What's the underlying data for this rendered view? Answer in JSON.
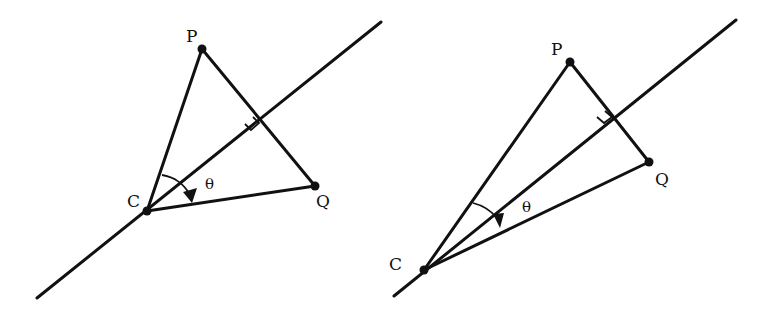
{
  "figures": [
    {
      "name": "left",
      "labels": {
        "P": "P",
        "Q": "Q",
        "C": "C",
        "theta": "θ"
      },
      "points": {
        "C": [
          147,
          211
        ],
        "P": [
          202,
          49
        ],
        "Q": [
          315,
          186
        ]
      },
      "axis_line": [
        [
          37,
          298
        ],
        [
          381,
          22
        ]
      ]
    },
    {
      "name": "right",
      "labels": {
        "P": "P",
        "Q": "Q",
        "C": "C",
        "theta": "θ"
      },
      "points": {
        "C": [
          424,
          270
        ],
        "P": [
          570,
          62
        ],
        "Q": [
          649,
          162
        ]
      },
      "axis_line": [
        [
          394,
          296
        ],
        [
          736,
          20
        ]
      ]
    }
  ],
  "colors": {
    "stroke": "#111111",
    "background": "#ffffff"
  }
}
